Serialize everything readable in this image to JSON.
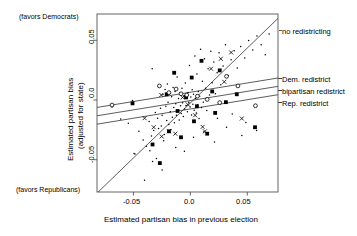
{
  "chart_data": {
    "type": "scatter",
    "title": "",
    "xlabel": "Estimated partisan bias in previous election",
    "ylabel": "Estimated partisan bias (adjusted for state)",
    "ylabel_line1": "Estimated partisan bias",
    "ylabel_line2": "(adjusted for state)",
    "xlim": [
      -0.082,
      0.077
    ],
    "ylim": [
      -0.077,
      0.072
    ],
    "xticks": [
      -0.05,
      0.0,
      0.05
    ],
    "xticklabels": [
      "-0.05",
      "0.0",
      "0.05"
    ],
    "yticks": [
      0.05,
      0.0,
      -0.05
    ],
    "yticklabels": [
      "0.05",
      "0.0",
      "-0.05"
    ],
    "grid": false,
    "legend_position": "right-outside",
    "annotations": [
      {
        "name": "favors-democrats",
        "text": "(favors Democrats)",
        "position": "top-left-outside"
      },
      {
        "name": "favors-republicans",
        "text": "(favors Republicans)",
        "position": "bottom-left-outside"
      }
    ],
    "lines": [
      {
        "name": "no redistricting",
        "label": "no redistricting",
        "slope": 0.92,
        "intercept": -0.0025,
        "style": "solid",
        "label_y": 0.062
      },
      {
        "name": "Dem. redistrict",
        "label": "Dem. redistrict",
        "slope": 0.155,
        "intercept": 0.0065,
        "style": "solid",
        "label_y": 0.0185
      },
      {
        "name": "bipartisan redistrict",
        "label": "bipartisan redistrict",
        "slope": 0.155,
        "intercept": -0.0005,
        "style": "solid",
        "label_y": 0.0095
      },
      {
        "name": "Rep. redistrict",
        "label": "Rep. redistrict",
        "slope": 0.155,
        "intercept": -0.0075,
        "style": "solid",
        "label_y": 0.0015
      }
    ],
    "marker_types": [
      "dot",
      "filled-square",
      "open-circle",
      "x"
    ],
    "series": [
      {
        "name": "dot",
        "marker": "dot",
        "points": [
          [
            -0.0545,
            -0.0195
          ],
          [
            -0.0508,
            -0.0004
          ],
          [
            -0.0495,
            -0.0448
          ],
          [
            -0.0487,
            -0.0452
          ],
          [
            -0.0452,
            -0.0262
          ],
          [
            -0.0415,
            -0.0335
          ],
          [
            -0.0386,
            -0.0388
          ],
          [
            -0.0362,
            -0.018
          ],
          [
            -0.0356,
            -0.0425
          ],
          [
            -0.0341,
            -0.0302
          ],
          [
            -0.0335,
            0.0262
          ],
          [
            -0.0322,
            -0.0256
          ],
          [
            -0.0308,
            -0.0104
          ],
          [
            -0.0298,
            -0.049
          ],
          [
            -0.0288,
            -0.0152
          ],
          [
            -0.0279,
            -0.0238
          ],
          [
            -0.0268,
            0.0117
          ],
          [
            -0.0262,
            -0.0068
          ],
          [
            -0.0255,
            -0.0218
          ],
          [
            -0.0248,
            -0.0128
          ],
          [
            -0.0241,
            0.0046
          ],
          [
            -0.0235,
            -0.034
          ],
          [
            -0.0228,
            -0.0288
          ],
          [
            -0.0222,
            0.0088
          ],
          [
            -0.0215,
            -0.0052
          ],
          [
            -0.0208,
            -0.0172
          ],
          [
            -0.0202,
            0.0135
          ],
          [
            -0.0196,
            -0.0018
          ],
          [
            -0.0189,
            -0.0205
          ],
          [
            -0.0182,
            0.0052
          ],
          [
            -0.0176,
            -0.0098
          ],
          [
            -0.017,
            -0.0248
          ],
          [
            -0.0164,
            0.0028
          ],
          [
            -0.0158,
            -0.0145
          ],
          [
            -0.0152,
            0.0105
          ],
          [
            -0.0146,
            -0.0062
          ],
          [
            -0.014,
            -0.019
          ],
          [
            -0.0134,
            0.0072
          ],
          [
            -0.0128,
            -0.0032
          ],
          [
            -0.0122,
            -0.0128
          ],
          [
            -0.0116,
            0.0192
          ],
          [
            -0.011,
            -0.0086
          ],
          [
            -0.0104,
            0.0012
          ],
          [
            -0.0098,
            -0.0168
          ],
          [
            -0.0092,
            0.0058
          ],
          [
            -0.0086,
            -0.0048
          ],
          [
            -0.008,
            -0.0112
          ],
          [
            -0.0074,
            0.0098
          ],
          [
            -0.0068,
            -0.0022
          ],
          [
            -0.0062,
            -0.0138
          ],
          [
            -0.0056,
            0.0035
          ],
          [
            -0.005,
            -0.0075
          ],
          [
            -0.0044,
            0.0142
          ],
          [
            -0.0038,
            -0.0045
          ],
          [
            -0.0032,
            0.0018
          ],
          [
            -0.0026,
            -0.0098
          ],
          [
            -0.002,
            0.0062
          ],
          [
            -0.0014,
            -0.0018
          ],
          [
            -0.0008,
            0.0288
          ],
          [
            -0.0002,
            -0.0058
          ],
          [
            0.0004,
            0.0025
          ],
          [
            0.001,
            -0.0125
          ],
          [
            0.0016,
            0.0085
          ],
          [
            0.0022,
            -0.0035
          ],
          [
            0.0028,
            0.0048
          ],
          [
            0.0034,
            -0.0085
          ],
          [
            0.004,
            0.0368
          ],
          [
            0.0046,
            0.0012
          ],
          [
            0.0052,
            -0.0108
          ],
          [
            0.0058,
            0.0218
          ],
          [
            0.0064,
            -0.0042
          ],
          [
            0.007,
            0.0072
          ],
          [
            0.0076,
            -0.0155
          ],
          [
            0.0082,
            0.0032
          ],
          [
            0.009,
            0.0425
          ],
          [
            0.0098,
            -0.0062
          ],
          [
            0.0106,
            0.0158
          ],
          [
            0.0114,
            -0.0018
          ],
          [
            0.0124,
            0.0345
          ],
          [
            0.0134,
            0.0098
          ],
          [
            0.0144,
            -0.0088
          ],
          [
            0.0156,
            0.0262
          ],
          [
            0.0168,
            0.0042
          ],
          [
            0.018,
            0.0408
          ],
          [
            0.0192,
            0.0145
          ],
          [
            0.0206,
            0.0318
          ],
          [
            0.022,
            0.0052
          ],
          [
            0.0235,
            0.0228
          ],
          [
            0.0252,
            0.0395
          ],
          [
            0.0268,
            0.0128
          ],
          [
            0.0288,
            0.0285
          ],
          [
            0.0308,
            0.0462
          ],
          [
            0.0332,
            0.0205
          ],
          [
            0.0358,
            0.0338
          ],
          [
            0.0385,
            0.0412
          ],
          [
            0.0412,
            0.0268
          ],
          [
            0.0442,
            0.0448
          ],
          [
            0.0478,
            0.0352
          ],
          [
            0.0512,
            0.0498
          ],
          [
            0.0548,
            0.0418
          ],
          [
            0.0585,
            0.0535
          ],
          [
            0.0622,
            0.0462
          ],
          [
            0.0658,
            0.0378
          ],
          [
            0.0692,
            0.0552
          ],
          [
            -0.0332,
            -0.0515
          ],
          [
            -0.0248,
            -0.0585
          ],
          [
            -0.0402,
            -0.0672
          ],
          [
            -0.0128,
            -0.0398
          ],
          [
            -0.0052,
            -0.0428
          ],
          [
            0.0028,
            -0.0312
          ],
          [
            0.0118,
            -0.0268
          ],
          [
            0.0212,
            -0.0352
          ],
          [
            0.0318,
            -0.0228
          ],
          [
            0.0452,
            -0.0298
          ],
          [
            0.0582,
            -0.0255
          ],
          [
            0.0238,
            -0.0152
          ],
          [
            0.0368,
            -0.0118
          ],
          [
            0.0488,
            -0.0188
          ],
          [
            -0.0612,
            -0.0158
          ],
          [
            -0.0688,
            -0.0058
          ]
        ]
      },
      {
        "name": "filled-square",
        "marker": "filled-square",
        "points": [
          [
            -0.0508,
            -0.0028
          ],
          [
            -0.0332,
            -0.0372
          ],
          [
            -0.0188,
            -0.0262
          ],
          [
            -0.0142,
            0.0228
          ],
          [
            -0.0082,
            -0.0312
          ],
          [
            -0.0038,
            0.0022
          ],
          [
            0.0012,
            0.0188
          ],
          [
            0.0058,
            -0.0052
          ],
          [
            0.0098,
            0.0328
          ],
          [
            0.0148,
            -0.0282
          ],
          [
            0.0192,
            0.0072
          ],
          [
            0.0258,
            0.0248
          ],
          [
            0.0312,
            -0.0018
          ],
          [
            0.0408,
            0.0048
          ],
          [
            0.0568,
            -0.0228
          ],
          [
            -0.0268,
            -0.0528
          ],
          [
            -0.0112,
            -0.0092
          ],
          [
            0.0032,
            -0.0178
          ],
          [
            0.0218,
            -0.0108
          ],
          [
            -0.0208,
            0.0048
          ]
        ]
      },
      {
        "name": "open-circle",
        "marker": "open-circle",
        "points": [
          [
            -0.0688,
            -0.0042
          ],
          [
            -0.0272,
            0.0118
          ],
          [
            -0.0188,
            0.0062
          ],
          [
            -0.0082,
            0.0052
          ],
          [
            -0.0032,
            0.0042
          ],
          [
            0.0062,
            0.0032
          ],
          [
            0.0148,
            0.0005
          ],
          [
            0.0258,
            -0.0022
          ],
          [
            0.0418,
            0.0118
          ],
          [
            0.0572,
            -0.0048
          ],
          [
            0.0318,
            0.0198
          ],
          [
            -0.0125,
            0.0092
          ]
        ]
      },
      {
        "name": "x",
        "marker": "x",
        "points": [
          [
            -0.0402,
            -0.0152
          ],
          [
            -0.0322,
            -0.0228
          ],
          [
            -0.0255,
            0.0042
          ],
          [
            -0.0188,
            -0.0262
          ],
          [
            -0.0132,
            -0.0282
          ],
          [
            -0.0068,
            0.0022
          ],
          [
            -0.0022,
            -0.0038
          ],
          [
            0.0042,
            -0.0128
          ],
          [
            0.0108,
            -0.0225
          ],
          [
            0.0182,
            0.0262
          ],
          [
            0.0268,
            0.0345
          ],
          [
            0.0358,
            0.0398
          ],
          [
            0.0452,
            -0.0155
          ],
          [
            0.0298,
            0.0152
          ],
          [
            -0.0252,
            -0.0305
          ],
          [
            0.0128,
            -0.0262
          ]
        ]
      }
    ]
  },
  "axis": {
    "x_title": "Estimated partisan bias in previous election",
    "y_title_line1": "Estimated partisan bias",
    "y_title_line2": "(adjusted for state)",
    "x_tick_0": "-0.05",
    "x_tick_1": "0.0",
    "x_tick_2": "0.05",
    "y_tick_0": "0.05",
    "y_tick_1": "0.0",
    "y_tick_2": "-0.05"
  },
  "notes": {
    "top_left": "(favors Democrats)",
    "bottom_left": "(favors Republicans)"
  },
  "line_labels": {
    "no_redistricting": "no redistricting",
    "dem_redistrict": "Dem. redistrict",
    "bipartisan_redistrict": "bipartisan redistrict",
    "rep_redistrict": "Rep. redistrict"
  },
  "colors": {
    "ink": "#000000",
    "background": "#ffffff",
    "frame": "#555555"
  }
}
